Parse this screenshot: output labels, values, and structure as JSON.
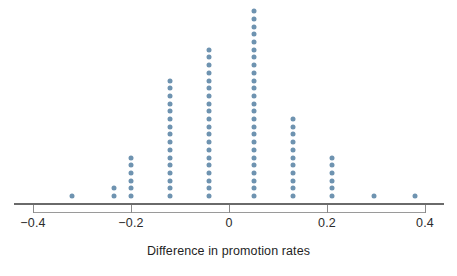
{
  "chart_data": {
    "type": "dotplot",
    "title": "",
    "subtitle": "",
    "xlabel": "Difference in promotion rates",
    "ylabel": "",
    "xlim": [
      -0.45,
      0.45
    ],
    "grid": false,
    "legend": "none",
    "dot_color": "#6e93b0",
    "axis_color": "#6a6a6a",
    "xticks": [
      -0.4,
      -0.2,
      0,
      0.2,
      0.4
    ],
    "xtick_labels": [
      "−0.4",
      "−0.2",
      "0",
      "0.2",
      "0.4"
    ],
    "stacks": [
      {
        "x": -0.32,
        "count": 1
      },
      {
        "x": -0.235,
        "count": 2
      },
      {
        "x": -0.2,
        "count": 6
      },
      {
        "x": -0.12,
        "count": 16
      },
      {
        "x": -0.04,
        "count": 20
      },
      {
        "x": 0.05,
        "count": 25
      },
      {
        "x": 0.13,
        "count": 11
      },
      {
        "x": 0.21,
        "count": 6
      },
      {
        "x": 0.295,
        "count": 1
      },
      {
        "x": 0.38,
        "count": 1
      }
    ],
    "total_points": 89,
    "dot_spacing_px": 7.7,
    "baseline_y_px": 196,
    "x_pixel_origin": 229,
    "x_pixel_per_unit": 490
  }
}
